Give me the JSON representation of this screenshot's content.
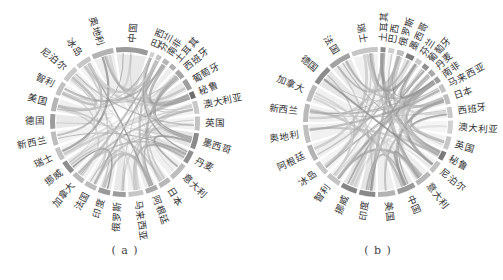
{
  "figure": {
    "panels": [
      {
        "id": "a",
        "caption": "( a )",
        "center": [
          125,
          122
        ],
        "start_angle": -97,
        "labels": [
          "中国",
          "巴西",
          "芬兰",
          "南非",
          "土耳其",
          "西班牙",
          "葡萄牙",
          "秘鲁",
          "澳大利亚",
          "英国",
          "墨西哥",
          "丹麦",
          "意大利",
          "日本",
          "阿根廷",
          "马来西亚",
          "俄罗斯",
          "印度",
          "法国",
          "加拿大",
          "挪威",
          "瑞士",
          "新西兰",
          "德国",
          "美国",
          "智利",
          "尼泊尔",
          "冰岛",
          "奥地利"
        ],
        "weights": [
          3.2,
          0.4,
          0.5,
          0.6,
          0.6,
          0.9,
          1.1,
          0.7,
          1.3,
          1.4,
          1.6,
          1.3,
          1.8,
          1.2,
          1.2,
          1.5,
          1.3,
          1.2,
          1.2,
          1.2,
          1.3,
          1.3,
          1.4,
          1.5,
          1.4,
          1.4,
          1.6,
          1.5,
          2.2
        ],
        "shades": [
          "#9a9a9a",
          "#cfcfcf",
          "#c4c4c4",
          "#b5b5b5",
          "#b0b0b0",
          "#a6a6a6",
          "#9e9e9e",
          "#6f6f6f",
          "#c8c8c8",
          "#c2c2c2",
          "#8a8a8a",
          "#8f8f8f",
          "#bdbdbd",
          "#b8b8b8",
          "#a9a9a9",
          "#c6c6c6",
          "#9d9d9d",
          "#9a9a9a",
          "#bcbcbc",
          "#bababa",
          "#8e8e8e",
          "#c3c3c3",
          "#bdbdbd",
          "#9c9c9c",
          "#b5b5b5",
          "#c2c2c2",
          "#c9c9c9",
          "#c6c6c6",
          "#b3b3b3"
        ]
      },
      {
        "id": "b",
        "caption": "( b )",
        "center": [
          127,
          122
        ],
        "start_angle": -88,
        "labels": [
          "土耳其",
          "巴西",
          "俄罗斯",
          "墨西哥",
          "芬兰",
          "葡萄牙",
          "丹麦",
          "南非",
          "马来西亚",
          "日本",
          "西班牙",
          "澳大利亚",
          "英国",
          "秘鲁",
          "尼泊尔",
          "意大利",
          "中国",
          "美国",
          "印度",
          "挪威",
          "智利",
          "冰岛",
          "阿根廷",
          "奥地利",
          "新西兰",
          "加拿大",
          "德国",
          "法国",
          "瑞士"
        ],
        "weights": [
          0.5,
          0.6,
          0.7,
          0.8,
          0.6,
          0.6,
          0.6,
          0.6,
          0.8,
          1.0,
          1.1,
          1.3,
          1.3,
          0.9,
          1.2,
          1.6,
          1.8,
          1.7,
          1.6,
          1.6,
          1.4,
          1.4,
          1.6,
          1.8,
          1.8,
          1.7,
          1.9,
          2.2,
          2.6
        ],
        "shades": [
          "#8a8a8a",
          "#cfcfcf",
          "#bfbfbf",
          "#7d7d7d",
          "#c9c9c9",
          "#8f8f8f",
          "#a8a8a8",
          "#9d9d9d",
          "#c4c4c4",
          "#bebebe",
          "#c8c8c8",
          "#d0d0d0",
          "#c6c6c6",
          "#7a7a7a",
          "#c2c2c2",
          "#b7b7b7",
          "#9a9a9a",
          "#b3b3b3",
          "#8a8a8a",
          "#858585",
          "#c4c4c4",
          "#c7c7c7",
          "#b3b3b3",
          "#bfbfbf",
          "#b9b9b9",
          "#bbbbbb",
          "#8c8c8c",
          "#a2a2a2",
          "#c6c6c6"
        ]
      }
    ],
    "ring": {
      "inner_radius": 70,
      "outer_radius": 75,
      "label_radius": 80,
      "gap_deg": 2.2
    },
    "chord_color": "#8c8c8c"
  }
}
